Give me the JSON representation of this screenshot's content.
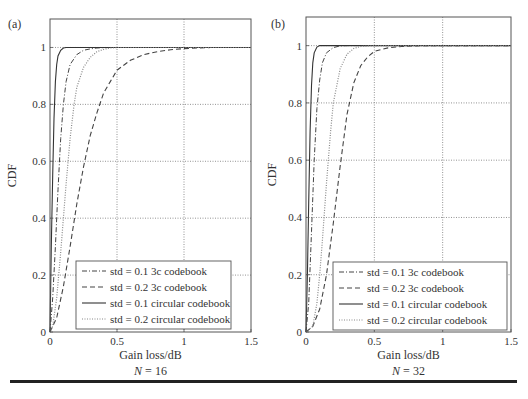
{
  "figure": {
    "panels": [
      {
        "id": "a",
        "panel_label": "(a)",
        "caption": "N = 16",
        "caption_var": "N",
        "caption_value": "= 16",
        "xlabel": "Gain loss/dB",
        "ylabel": "CDF"
      },
      {
        "id": "b",
        "panel_label": "(b)",
        "caption": "N = 32",
        "caption_var": "N",
        "caption_value": "= 32",
        "xlabel": "Gain loss/dB",
        "ylabel": "CDF"
      }
    ]
  },
  "chart_data": [
    {
      "type": "line",
      "title": "(a)",
      "subtitle": "N = 16",
      "xlabel": "Gain loss/dB",
      "ylabel": "CDF",
      "xlim": [
        0,
        1.5
      ],
      "ylim": [
        0,
        1.1
      ],
      "xticks": [
        0,
        0.5,
        1,
        1.5
      ],
      "xtick_labels": [
        "0",
        "0.5",
        "1",
        "1.5"
      ],
      "yticks": [
        0,
        0.2,
        0.4,
        0.6,
        0.8,
        1
      ],
      "ytick_labels": [
        "0",
        "0.2",
        "0.4",
        "0.6",
        "0.8",
        "1"
      ],
      "grid": true,
      "legend_position": "lower right",
      "series": [
        {
          "name": "std = 0.1 3c codebook",
          "style": "dashdot",
          "x": [
            0,
            0.02,
            0.04,
            0.06,
            0.08,
            0.1,
            0.12,
            0.15,
            0.2,
            0.25,
            0.3,
            0.35,
            0.4,
            0.45,
            0.5
          ],
          "y": [
            0,
            0.12,
            0.3,
            0.5,
            0.68,
            0.8,
            0.88,
            0.94,
            0.975,
            0.99,
            0.995,
            0.998,
            0.999,
            1.0,
            1.0
          ]
        },
        {
          "name": "std = 0.2 3c codebook",
          "style": "dashed",
          "x": [
            0,
            0.05,
            0.1,
            0.15,
            0.2,
            0.25,
            0.3,
            0.35,
            0.4,
            0.45,
            0.5,
            0.6,
            0.7,
            0.8,
            0.9,
            1.0,
            1.1,
            1.2
          ],
          "y": [
            0,
            0.05,
            0.16,
            0.3,
            0.45,
            0.58,
            0.69,
            0.77,
            0.84,
            0.88,
            0.92,
            0.955,
            0.975,
            0.985,
            0.992,
            0.996,
            0.998,
            1.0
          ]
        },
        {
          "name": "std = 0.1 circular codebook",
          "style": "solid",
          "x": [
            0,
            0.01,
            0.02,
            0.03,
            0.04,
            0.05,
            0.06,
            0.08,
            0.1,
            0.12,
            0.15
          ],
          "y": [
            0,
            0.3,
            0.55,
            0.75,
            0.88,
            0.94,
            0.97,
            0.99,
            0.998,
            1.0,
            1.0
          ]
        },
        {
          "name": "std = 0.2 circular codebook",
          "style": "dotted",
          "x": [
            0,
            0.02,
            0.05,
            0.08,
            0.1,
            0.12,
            0.15,
            0.18,
            0.2,
            0.25,
            0.3,
            0.35,
            0.4,
            0.45,
            0.5
          ],
          "y": [
            0,
            0.02,
            0.12,
            0.28,
            0.4,
            0.52,
            0.68,
            0.8,
            0.86,
            0.93,
            0.965,
            0.985,
            0.993,
            0.998,
            1.0
          ]
        }
      ]
    },
    {
      "type": "line",
      "title": "(b)",
      "subtitle": "N = 32",
      "xlabel": "Gain loss/dB",
      "ylabel": "CDF",
      "xlim": [
        0,
        1.5
      ],
      "ylim": [
        0,
        1.1
      ],
      "xticks": [
        0,
        0.5,
        1,
        1.5
      ],
      "xtick_labels": [
        "0",
        "0.5",
        "1",
        "1.5"
      ],
      "yticks": [
        0,
        0.2,
        0.4,
        0.6,
        0.8,
        1
      ],
      "ytick_labels": [
        "0",
        "0.2",
        "0.4",
        "0.6",
        "0.8",
        "1"
      ],
      "grid": true,
      "legend_position": "lower right",
      "series": [
        {
          "name": "std = 0.1 3c codebook",
          "style": "dashdot",
          "x": [
            0,
            0.02,
            0.04,
            0.06,
            0.08,
            0.1,
            0.12,
            0.15,
            0.2,
            0.25,
            0.3
          ],
          "y": [
            0,
            0.1,
            0.35,
            0.6,
            0.78,
            0.88,
            0.94,
            0.975,
            0.993,
            0.999,
            1.0
          ]
        },
        {
          "name": "std = 0.2 3c codebook",
          "style": "dashed",
          "x": [
            0,
            0.05,
            0.1,
            0.15,
            0.2,
            0.25,
            0.3,
            0.35,
            0.4,
            0.45,
            0.5,
            0.6,
            0.7,
            0.8,
            0.9,
            1.0
          ],
          "y": [
            0,
            0.02,
            0.08,
            0.2,
            0.38,
            0.58,
            0.76,
            0.87,
            0.93,
            0.96,
            0.98,
            0.992,
            0.997,
            0.999,
            1.0,
            1.0
          ]
        },
        {
          "name": "std = 0.1 circular codebook",
          "style": "solid",
          "x": [
            0,
            0.01,
            0.02,
            0.03,
            0.04,
            0.05,
            0.06,
            0.08,
            0.1,
            0.12
          ],
          "y": [
            0,
            0.2,
            0.45,
            0.7,
            0.86,
            0.94,
            0.975,
            0.995,
            1.0,
            1.0
          ]
        },
        {
          "name": "std = 0.2 circular codebook",
          "style": "dotted",
          "x": [
            0,
            0.05,
            0.08,
            0.1,
            0.12,
            0.15,
            0.18,
            0.2,
            0.25,
            0.3,
            0.35,
            0.4,
            0.45,
            0.5
          ],
          "y": [
            0,
            0.02,
            0.1,
            0.2,
            0.32,
            0.52,
            0.7,
            0.8,
            0.92,
            0.97,
            0.99,
            0.997,
            0.999,
            1.0
          ]
        }
      ]
    }
  ]
}
